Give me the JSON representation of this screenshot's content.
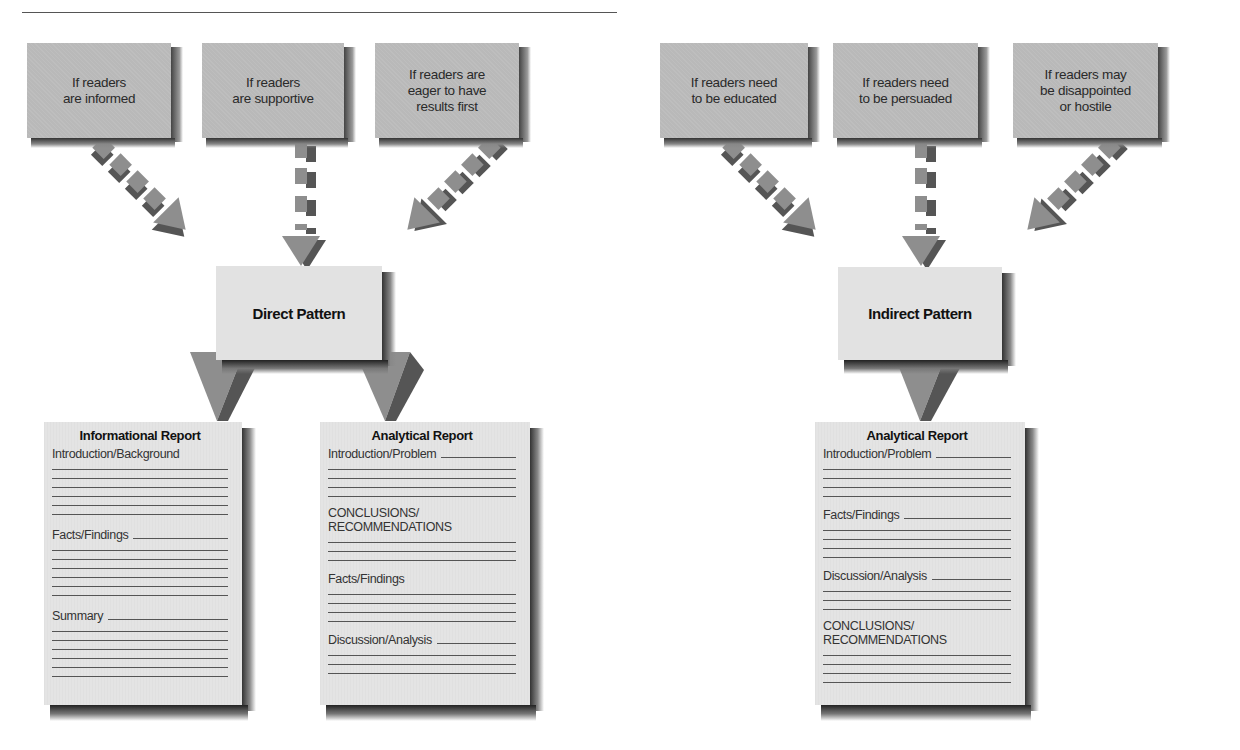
{
  "diagram": {
    "direct": {
      "conditions": [
        {
          "lines": [
            "If readers",
            "are informed"
          ]
        },
        {
          "lines": [
            "If readers",
            "are supportive"
          ]
        },
        {
          "lines": [
            "If readers are",
            "eager to have",
            "results first"
          ]
        }
      ],
      "pattern_label": "Direct Pattern",
      "reports": [
        {
          "title": "Informational Report",
          "sections": [
            {
              "label": "Introduction/Background",
              "lines": 6
            },
            {
              "label": "Facts/Findings",
              "lines": 6
            },
            {
              "label": "Summary",
              "lines": 6
            }
          ]
        },
        {
          "title": "Analytical Report",
          "sections": [
            {
              "label": "Introduction/Problem",
              "lines": 4
            },
            {
              "label": "CONCLUSIONS/\nRECOMMENDATIONS",
              "lines": 3
            },
            {
              "label": "Facts/Findings",
              "lines": 4
            },
            {
              "label": "Discussion/Analysis",
              "lines": 3
            }
          ]
        }
      ]
    },
    "indirect": {
      "conditions": [
        {
          "lines": [
            "If readers need",
            "to be educated"
          ]
        },
        {
          "lines": [
            "If readers need",
            "to be persuaded"
          ]
        },
        {
          "lines": [
            "If readers may",
            "be disappointed",
            "or hostile"
          ]
        }
      ],
      "pattern_label": "Indirect Pattern",
      "reports": [
        {
          "title": "Analytical Report",
          "sections": [
            {
              "label": "Introduction/Problem",
              "lines": 4
            },
            {
              "label": "Facts/Findings",
              "lines": 4
            },
            {
              "label": "Discussion/Analysis",
              "lines": 3
            },
            {
              "label": "CONCLUSIONS/\nRECOMMENDATIONS",
              "lines": 4
            }
          ]
        }
      ]
    },
    "colors": {
      "condition_box": "#b9b9b9",
      "pattern_box": "#e2e2e2",
      "report_page": "#e4e4e4",
      "arrow": "#8e8e8e",
      "text": "#2a2a2a"
    }
  }
}
